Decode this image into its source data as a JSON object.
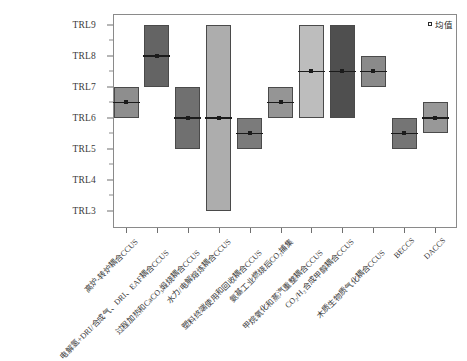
{
  "chart_data": {
    "type": "bar",
    "title": "",
    "subtitle": "",
    "xlabel": "",
    "ylabel": "",
    "ylim": [
      "TRL3",
      "TRL9"
    ],
    "y_tick_labels": [
      "TRL9",
      "TRL8",
      "TRL7",
      "TRL6",
      "TRL5",
      "TRL4",
      "TRL3"
    ],
    "y_tick_values": [
      9,
      8,
      7,
      6,
      5,
      4,
      3
    ],
    "y_minor_ticks": [
      8.5,
      7.5,
      6.5,
      5.5,
      4.5,
      3.5
    ],
    "grid": false,
    "legend_position": "top-right",
    "legend": [
      {
        "label": "均值",
        "marker": "open-square"
      }
    ],
    "categories": [
      "高炉-转炉耦合CCUS",
      "电解氢+DRI/合成气、DRI、EAF耦合CCUS",
      "过程加热和CaCO3煅烧耦合CCUS",
      "水力/电解熔炼耦合CCUS",
      "塑料终端使用和回收耦合CCUS",
      "氨基工业燃烧后CO2捕集",
      "甲烷氧化和蒸汽重整耦合CCUS",
      "CO2/H2合成甲醇耦合CCUS",
      "木质生物质气化耦合CCUS",
      "BECCS",
      "DACCS"
    ],
    "series": [
      {
        "name": "最小值",
        "values": [
          6.0,
          7.0,
          5.0,
          3.0,
          5.0,
          6.0,
          6.0,
          6.0,
          7.0,
          5.0,
          5.5
        ]
      },
      {
        "name": "最大值",
        "values": [
          7.0,
          9.0,
          7.0,
          9.0,
          6.0,
          7.0,
          9.0,
          9.0,
          8.0,
          6.0,
          6.5
        ]
      },
      {
        "name": "均值",
        "values": [
          6.5,
          8.0,
          6.0,
          6.0,
          5.5,
          6.5,
          7.5,
          7.5,
          7.5,
          5.5,
          6.0
        ]
      }
    ],
    "bar_colors": [
      "#8E8E8E",
      "#646464",
      "#707070",
      "#ADADAD",
      "#7B7B7B",
      "#959595",
      "#BDBDBD",
      "#4F4F4F",
      "#8A8A8A",
      "#757575",
      "#989898"
    ]
  },
  "x_labels": [
    {
      "text": "高炉-转炉耦合CCUS",
      "row": 0
    },
    {
      "text": "电解氢+DRI/合成气、DRI、EAF耦合CCUS",
      "row": 1
    },
    {
      "text": "过程加热和CaCO₃煅烧耦合CCUS",
      "row": 1
    },
    {
      "text": "水力/电解熔炼耦合CCUS",
      "row": 0
    },
    {
      "text": "塑料终端使用和回收耦合CCUS",
      "row": 1
    },
    {
      "text": "氨基工业燃烧后CO₂捕集",
      "row": 0
    },
    {
      "text": "甲烷氧化和蒸汽重整耦合CCUS",
      "row": 1
    },
    {
      "text": "CO₂/H₂合成甲醇耦合CCUS",
      "row": 0
    },
    {
      "text": "木质生物质气化耦合CCUS",
      "row": 1
    },
    {
      "text": "BECCS",
      "row": 0
    },
    {
      "text": "DACCS",
      "row": 0
    }
  ],
  "legend": {
    "mean_label": "均值"
  },
  "axis": {
    "frame_color": "#8a8a8a",
    "tick_color": "#6f6f6f",
    "text_color": "#3a3a3a"
  }
}
